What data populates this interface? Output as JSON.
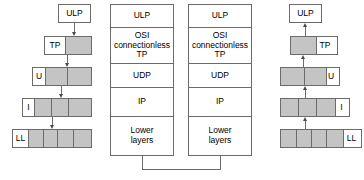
{
  "diagram": {
    "colors": {
      "outline": "#6b6b6b",
      "segment_fill": "#c4c4c4",
      "white_fill": "#ffffff",
      "arrow": "#4a4a4a"
    }
  },
  "left_stack": {
    "name": "sending-side-encapsulation",
    "ulp_label": "ULP",
    "pdus": [
      {
        "label": "TP",
        "segments": 2
      },
      {
        "label": "U",
        "segments": 3
      },
      {
        "label": "I",
        "segments": 4
      },
      {
        "label": "LL",
        "segments": 5
      }
    ]
  },
  "middle_stack_left": {
    "name": "protocol-stack-left",
    "layers": [
      {
        "lines": [
          "ULP"
        ]
      },
      {
        "lines": [
          "OSI",
          "connectionless",
          "TP"
        ]
      },
      {
        "lines": [
          "UDP"
        ]
      },
      {
        "lines": [
          "IP"
        ]
      },
      {
        "lines": [
          "Lower",
          "layers"
        ]
      }
    ]
  },
  "middle_stack_right": {
    "name": "protocol-stack-right",
    "layers": [
      {
        "lines": [
          "ULP"
        ]
      },
      {
        "lines": [
          "OSI",
          "connectionless",
          "TP"
        ]
      },
      {
        "lines": [
          "UDP"
        ]
      },
      {
        "lines": [
          "IP"
        ]
      },
      {
        "lines": [
          "Lower",
          "layers"
        ]
      }
    ]
  },
  "right_stack": {
    "name": "receiving-side-decapsulation",
    "ulp_label": "ULP",
    "pdus": [
      {
        "label": "TP",
        "segments": 2
      },
      {
        "label": "U",
        "segments": 3
      },
      {
        "label": "I",
        "segments": 4
      },
      {
        "label": "LL",
        "segments": 5
      }
    ]
  }
}
